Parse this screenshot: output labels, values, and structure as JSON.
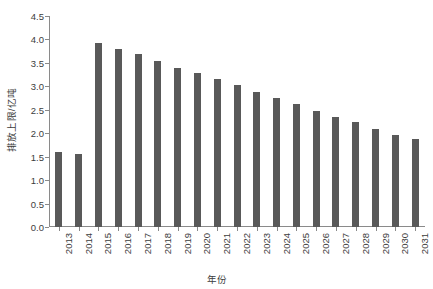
{
  "chart_data": {
    "type": "bar",
    "title": "",
    "subtitle": "",
    "xlabel": "年份",
    "ylabel": "排放上限/亿吨",
    "categories": [
      "2013",
      "2014",
      "2015",
      "2016",
      "2017",
      "2018",
      "2019",
      "2020",
      "2021",
      "2022",
      "2023",
      "2024",
      "2025",
      "2026",
      "2027",
      "2028",
      "2029",
      "2030",
      "2031"
    ],
    "values": [
      1.6,
      1.56,
      3.92,
      3.8,
      3.68,
      3.54,
      3.4,
      3.28,
      3.16,
      3.02,
      2.88,
      2.76,
      2.62,
      2.48,
      2.35,
      2.23,
      2.08,
      1.96,
      1.88
    ],
    "series": [
      {
        "name": "排放上限",
        "color": "#595959",
        "values": [
          1.6,
          1.56,
          3.92,
          3.8,
          3.68,
          3.54,
          3.4,
          3.28,
          3.16,
          3.02,
          2.88,
          2.76,
          2.62,
          2.48,
          2.35,
          2.23,
          2.08,
          1.96,
          1.88
        ]
      }
    ],
    "ylim": [
      0.0,
      4.5
    ],
    "ytick_values": [
      0.0,
      0.5,
      1.0,
      1.5,
      2.0,
      2.5,
      3.0,
      3.5,
      4.0,
      4.5
    ],
    "ytick_labels": [
      "0.0",
      "0.5",
      "1.0",
      "1.5",
      "2.0",
      "2.5",
      "3.0",
      "3.5",
      "4.0",
      "4.5"
    ],
    "grid": false,
    "legend": false,
    "legend_position": "none",
    "bar_color": "#595959",
    "axis_color": "#8a8a8a",
    "background_color": "#ffffff",
    "annotations": []
  },
  "axes": {
    "y_title": "排放上限/亿吨",
    "x_title": "年份"
  }
}
